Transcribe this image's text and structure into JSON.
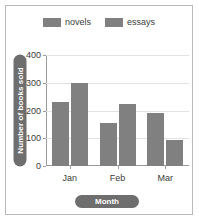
{
  "chart_data": {
    "type": "bar",
    "title": "",
    "xlabel": "Month",
    "ylabel": "Number of books sold",
    "categories": [
      "Jan",
      "Feb",
      "Mar"
    ],
    "series": [
      {
        "name": "novels",
        "values": [
          230,
          155,
          190
        ],
        "color": "#808080"
      },
      {
        "name": "essays",
        "values": [
          300,
          225,
          95
        ],
        "color": "#808080"
      }
    ],
    "ylim": [
      0,
      400
    ],
    "yticks": [
      0,
      100,
      200,
      300,
      400
    ],
    "ytick_labels": [
      "0",
      "100",
      "200",
      "300",
      "400"
    ],
    "grid": true,
    "legend_position": "top"
  },
  "style": {
    "background": "#ffffff",
    "frame_border": "#b9b9b9",
    "gridline_color": "#e2e2e2",
    "axis_color": "#9a9a9a",
    "bar_color": "#808080",
    "pill_background": "#6e6e6e",
    "pill_text_color": "#ffffff",
    "tick_text_color": "#3b3b3b"
  }
}
